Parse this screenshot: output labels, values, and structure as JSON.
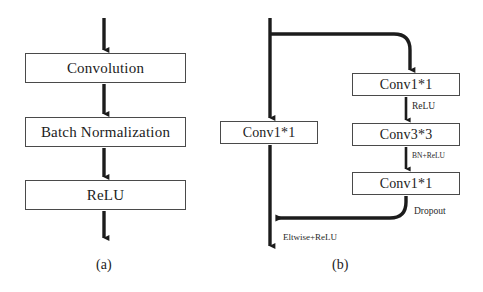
{
  "figure": {
    "background_color": "#ffffff",
    "stroke_color": "#1c1c1c",
    "box_border_color": "#4a4a4a",
    "text_color": "#1c1c1c"
  },
  "panel_a": {
    "caption": "(a)",
    "boxes": [
      {
        "label": "Convolution"
      },
      {
        "label": "Batch Normalization"
      },
      {
        "label": "ReLU"
      }
    ]
  },
  "panel_b": {
    "caption": "(b)",
    "shortcut_branch": {
      "box_label": "Conv1*1",
      "output_label": "Eltwise+ReLU"
    },
    "residual_branch": {
      "boxes": [
        {
          "label": "Conv1*1"
        },
        {
          "label": "Conv3*3"
        },
        {
          "label": "Conv1*1"
        }
      ],
      "edge_labels": [
        {
          "label": "ReLU"
        },
        {
          "label": "BN+ReLU"
        },
        {
          "label": "Dropout"
        }
      ]
    }
  }
}
